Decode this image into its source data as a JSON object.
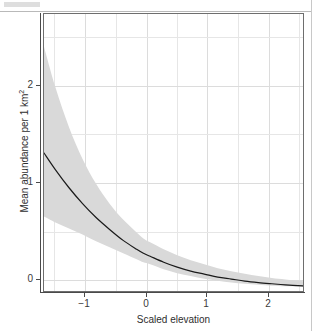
{
  "page": {
    "header_fragment": "",
    "background": "#ffffff"
  },
  "chart_data": {
    "type": "line",
    "title": "",
    "subtitle": "",
    "xlabel": "Scaled elevation",
    "ylabel_text": "Mean abundance per 1 km",
    "ylabel_superscript": "2",
    "xlim": [
      -1.47,
      2.36
    ],
    "ylim": [
      -0.03,
      2.76
    ],
    "xticks": [
      -1,
      0,
      1,
      2
    ],
    "xticklabels": [
      "−1",
      "0",
      "1",
      "2"
    ],
    "yticks": [
      0,
      1,
      2
    ],
    "yticklabels": [
      "0",
      "1",
      "2"
    ],
    "grid": true,
    "grid_minor": true,
    "grid_color": "#e6e6e6",
    "legend": null,
    "line_color": "#1a1a1a",
    "line_width": 1.2,
    "ribbon_color": "#d9d9d9",
    "ribbon_label": "confidence interval",
    "x": [
      -1.47,
      -1.3,
      -1.1,
      -0.9,
      -0.7,
      -0.5,
      -0.3,
      -0.1,
      0.0,
      0.1,
      0.3,
      0.5,
      0.7,
      0.9,
      1.1,
      1.3,
      1.5,
      1.7,
      1.9,
      2.1,
      2.36
    ],
    "series": [
      {
        "name": "Mean abundance",
        "values": [
          1.36,
          1.19,
          1.01,
          0.85,
          0.71,
          0.59,
          0.48,
          0.39,
          0.35,
          0.32,
          0.26,
          0.21,
          0.17,
          0.14,
          0.11,
          0.09,
          0.07,
          0.055,
          0.043,
          0.032,
          0.021
        ]
      },
      {
        "name": "Upper 95% bound",
        "values": [
          2.43,
          2.02,
          1.62,
          1.3,
          1.05,
          0.85,
          0.69,
          0.56,
          0.5,
          0.46,
          0.39,
          0.33,
          0.28,
          0.24,
          0.2,
          0.17,
          0.145,
          0.12,
          0.1,
          0.085,
          0.068
        ]
      },
      {
        "name": "Lower 95% bound",
        "values": [
          0.72,
          0.66,
          0.6,
          0.54,
          0.47,
          0.41,
          0.35,
          0.29,
          0.26,
          0.24,
          0.19,
          0.15,
          0.12,
          0.093,
          0.072,
          0.055,
          0.042,
          0.032,
          0.024,
          0.017,
          0.011
        ]
      }
    ]
  },
  "gridlines": {
    "vertical_major_px": [
      41,
      103,
      163,
      225
    ],
    "vertical_minor_px": [
      10,
      72,
      133,
      194,
      255
    ],
    "horizontal_major_px": [
      72,
      169,
      266
    ],
    "horizontal_minor_px": [
      23,
      120,
      218
    ]
  },
  "ticks_px": {
    "y": [
      {
        "label": "2",
        "top": 85
      },
      {
        "label": "1",
        "top": 182
      },
      {
        "label": "0",
        "top": 279
      }
    ],
    "x": [
      {
        "label": "−1",
        "left": 84
      },
      {
        "label": "0",
        "left": 146
      },
      {
        "label": "1",
        "left": 206
      },
      {
        "label": "2",
        "left": 268
      }
    ]
  }
}
